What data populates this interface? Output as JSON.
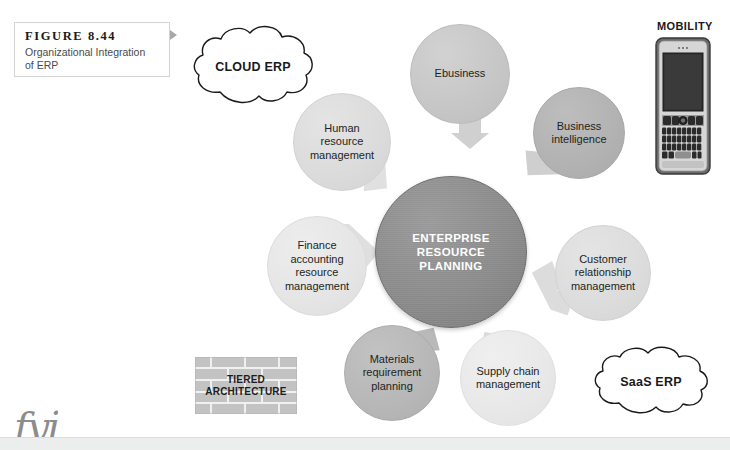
{
  "figure": {
    "number": "FIGURE 8.44",
    "caption": "Organizational Integration of ERP",
    "pointer_icon": "triangle-right-icon"
  },
  "center": {
    "label": "ENTERPRISE RESOURCE PLANNING",
    "line1": "ENTERPRISE",
    "line2": "RESOURCE",
    "line3": "PLANNING",
    "fill": "#8e8e8e",
    "text_color": "#ffffff"
  },
  "nodes": [
    {
      "id": "ebusiness",
      "label": "Ebusiness",
      "lines": [
        "Ebusiness"
      ],
      "fill": "#c7c7c7",
      "position": "top"
    },
    {
      "id": "business-intelligence",
      "label": "Business intelligence",
      "lines": [
        "Business",
        "intelligence"
      ],
      "fill": "#b4b4b4",
      "position": "top-right"
    },
    {
      "id": "customer-relationship-management",
      "label": "Customer relationship management",
      "lines": [
        "Customer",
        "relationship",
        "management"
      ],
      "fill": "#dedede",
      "position": "bottom-right"
    },
    {
      "id": "supply-chain-management",
      "label": "Supply chain management",
      "lines": [
        "Supply chain",
        "management"
      ],
      "fill": "#eaeaea",
      "position": "bottom"
    },
    {
      "id": "materials-requirement-planning",
      "label": "Materials requirement planning",
      "lines": [
        "Materials",
        "requirement",
        "planning"
      ],
      "fill": "#b9b9b9",
      "position": "bottom-left"
    },
    {
      "id": "finance-accounting-resource-management",
      "label": "Finance accounting resource management",
      "lines": [
        "Finance",
        "accounting",
        "resource",
        "management"
      ],
      "fill": "#e6e6e6",
      "position": "left"
    },
    {
      "id": "human-resource-management",
      "label": "Human resource management",
      "lines": [
        "Human",
        "resource",
        "management"
      ],
      "fill": "#dcdcdc",
      "position": "top-left"
    }
  ],
  "arrows": {
    "count": 7,
    "fill": "#d8d8d8",
    "direction": "inward-to-center"
  },
  "clouds": [
    {
      "id": "cloud-erp",
      "label": "CLOUD ERP"
    },
    {
      "id": "saas-erp",
      "label": "SaaS ERP"
    }
  ],
  "mobility": {
    "label": "MOBILITY",
    "device_icon": "smartphone-icon",
    "device_type": "qwerty-smartphone"
  },
  "tiered": {
    "line1": "TIERED",
    "line2": "ARCHITECTURE",
    "icon": "brick-wall-icon"
  },
  "page_artifacts": {
    "bottom_script_text": "fyi",
    "bottom_bar_color": "#eceded"
  }
}
